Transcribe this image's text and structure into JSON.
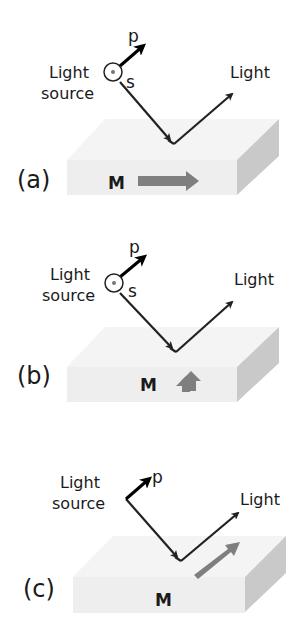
{
  "figure": {
    "colors": {
      "slab_top": "#f4f4f4",
      "slab_front": "#eeeeee",
      "slab_side": "#c8c8c8",
      "ray": "#222222",
      "magnetization_arrow": "#7f7f7f",
      "text": "#1a1a1a"
    },
    "panels": [
      {
        "label": "(a)",
        "source_label_line1": "Light",
        "source_label_line2": "source",
        "reflected_label": "Light",
        "p_label": "p",
        "s_label": "s",
        "magnetization_label": "M",
        "magnetization_direction": "in-plane, parallel to plane of incidence (longitudinal)"
      },
      {
        "label": "(b)",
        "source_label_line1": "Light",
        "source_label_line2": "source",
        "reflected_label": "Light",
        "p_label": "p",
        "s_label": "s",
        "magnetization_label": "M",
        "magnetization_direction": "out-of-plane (polar)"
      },
      {
        "label": "(c)",
        "source_label_line1": "Light",
        "source_label_line2": "source",
        "reflected_label": "Light",
        "p_label": "p",
        "magnetization_label": "M",
        "magnetization_direction": "in-plane, perpendicular to plane of incidence (transverse)"
      }
    ]
  }
}
